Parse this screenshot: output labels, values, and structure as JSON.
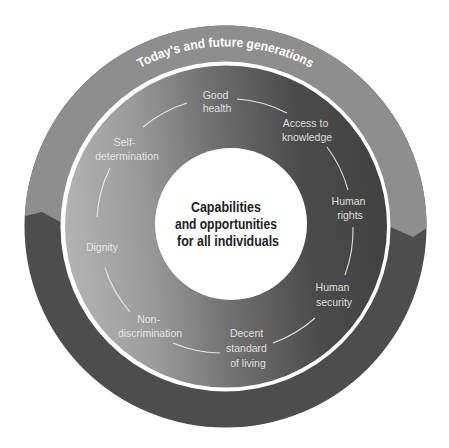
{
  "diagram": {
    "outer_ring_label": "Today's and future generations",
    "center_text": [
      "Capabilities",
      "and opportunities",
      "for all individuals"
    ],
    "labels": [
      {
        "id": "good-health",
        "lines": [
          "Good",
          "health"
        ]
      },
      {
        "id": "access-to-knowledge",
        "lines": [
          "Access to",
          "knowledge"
        ]
      },
      {
        "id": "human-rights",
        "lines": [
          "Human",
          "rights"
        ]
      },
      {
        "id": "human-security",
        "lines": [
          "Human",
          "security"
        ]
      },
      {
        "id": "decent-standard-of-living",
        "lines": [
          "Decent",
          "standard",
          "of living"
        ]
      },
      {
        "id": "non-discrimination",
        "lines": [
          "Non-",
          "discrimination"
        ]
      },
      {
        "id": "dignity",
        "lines": [
          "Dignity"
        ]
      },
      {
        "id": "self-determination",
        "lines": [
          "Self-",
          "determination"
        ]
      }
    ],
    "colors": {
      "outer_band_light": "#8e8e8e",
      "outer_band_dark": "#4d4d4d",
      "inner_gradient_light": "#b4b4b4",
      "inner_gradient_dark": "#414141",
      "center_disk": "#ffffff",
      "center_text": "#1e1e1e"
    }
  }
}
